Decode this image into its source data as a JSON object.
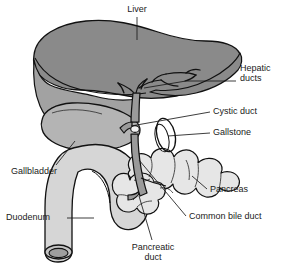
{
  "figure": {
    "kind": "anatomical-diagram",
    "width": 287,
    "height": 273,
    "background_color": "#ffffff",
    "line_color": "#111111",
    "text_color": "#1a1a1a"
  },
  "palette": {
    "liver_upper": "#8a8a8a",
    "liver_lower": "#a2a2a2",
    "gallbladder": "#b4b4b4",
    "duodenum": "#d6d6d6",
    "duodenum_rim": "#b0b0b0",
    "pancreas": "#e6e6e6",
    "duct": "#9a9a9a",
    "gallstone": "#f2f2f2",
    "outline": "#111111"
  },
  "labels": [
    {
      "id": "liver",
      "text": "Liver",
      "lines": [
        "Liver"
      ],
      "align": "center",
      "x": 113,
      "y": 4,
      "w": 48
    },
    {
      "id": "hepatic-ducts",
      "text": "Hepatic ducts",
      "lines": [
        "Hepatic",
        "ducts"
      ],
      "align": "left",
      "x": 240,
      "y": 68,
      "w": 46
    },
    {
      "id": "cystic-duct",
      "text": "Cystic duct",
      "lines": [
        "Cystic duct"
      ],
      "align": "left",
      "x": 213,
      "y": 107,
      "w": 70
    },
    {
      "id": "gallstone",
      "text": "Gallstone",
      "lines": [
        "Gallstone"
      ],
      "align": "left",
      "x": 213,
      "y": 128,
      "w": 62
    },
    {
      "id": "pancreas",
      "text": "Pancreas",
      "lines": [
        "Pancreas"
      ],
      "align": "left",
      "x": 210,
      "y": 186,
      "w": 62
    },
    {
      "id": "common-bile-duct",
      "text": "Common bile duct",
      "lines": [
        "Common bile duct"
      ],
      "align": "left",
      "x": 189,
      "y": 213,
      "w": 96
    },
    {
      "id": "gallbladder",
      "text": "Gallbladder",
      "lines": [
        "Gallbladder"
      ],
      "align": "left",
      "x": 11,
      "y": 168,
      "w": 70
    },
    {
      "id": "duodenum",
      "text": "Duodenum",
      "lines": [
        "Duodenum"
      ],
      "align": "left",
      "x": 6,
      "y": 212,
      "w": 62
    },
    {
      "id": "pancreatic-duct",
      "text": "Pancreatic duct",
      "lines": [
        "Pancreatic",
        "duct"
      ],
      "align": "center",
      "x": 122,
      "y": 244,
      "w": 62
    }
  ],
  "leaders": [
    {
      "id": "leader-liver",
      "for": "liver",
      "d": "M137,17 L137,40"
    },
    {
      "id": "leader-hepatic-ducts",
      "for": "hepatic-ducts",
      "d": "M236,81 L186,81 L144,88"
    },
    {
      "id": "leader-cystic-duct",
      "for": "cystic-duct",
      "d": "M210,112 L131,126"
    },
    {
      "id": "leader-gallstone",
      "for": "gallstone",
      "d": "M210,133 L168,136"
    },
    {
      "id": "leader-pancreas",
      "for": "pancreas",
      "d": "M207,189 L192,176"
    },
    {
      "id": "leader-common-bile-duct",
      "for": "common-bile-duct",
      "d": "M186,216 L139,160"
    },
    {
      "id": "leader-gallbladder",
      "for": "gallbladder",
      "d": "M56,165 L75,141"
    },
    {
      "id": "leader-duodenum",
      "for": "duodenum",
      "d": "M67,218 L94,218"
    },
    {
      "id": "leader-pancreatic-duct",
      "for": "pancreatic-duct",
      "d": "M152,240 L139,196"
    }
  ],
  "structures": [
    {
      "id": "liver",
      "name": "Liver",
      "fill": "#8a8a8a"
    },
    {
      "id": "liver-lobe",
      "name": "Liver inferior lobe",
      "fill": "#a2a2a2"
    },
    {
      "id": "gallbladder",
      "name": "Gallbladder",
      "fill": "#b4b4b4"
    },
    {
      "id": "duodenum",
      "name": "Duodenum",
      "fill": "#d6d6d6"
    },
    {
      "id": "pancreas",
      "name": "Pancreas",
      "fill": "#e6e6e6"
    },
    {
      "id": "hepatic-ducts",
      "name": "Hepatic ducts",
      "fill": "#9a9a9a"
    },
    {
      "id": "cystic-duct",
      "name": "Cystic duct",
      "fill": "#9a9a9a"
    },
    {
      "id": "common-bile-duct",
      "name": "Common bile duct",
      "fill": "#9a9a9a"
    },
    {
      "id": "pancreatic-duct",
      "name": "Pancreatic duct",
      "fill": "#9a9a9a"
    },
    {
      "id": "gallstone",
      "name": "Gallstone",
      "fill": "#f2f2f2"
    },
    {
      "id": "gallstone-ring",
      "name": "Gallstone ring",
      "fill": "none"
    }
  ]
}
